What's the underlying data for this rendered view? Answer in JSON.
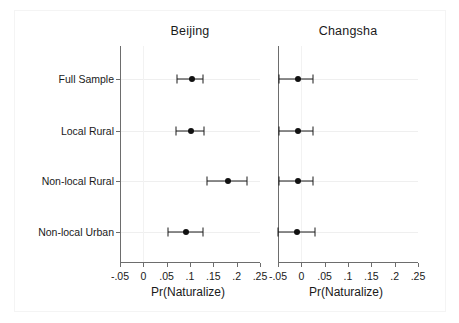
{
  "figure": {
    "background_color": "#ffffff",
    "foreground_color": "#1a1a1a",
    "grid_color": "#efefef",
    "axis_color": "#6d6d6d",
    "marker_color": "#111111"
  },
  "chart_data": {
    "type": "scatter",
    "title": "",
    "subtitle": "",
    "xlabel": "Pr(Naturalize)",
    "ylabel": "",
    "grid": true,
    "legend": null,
    "orientation": "horizontal",
    "plot_style": "coefficient plot with 95% confidence intervals",
    "xlim": [
      -0.05,
      0.25
    ],
    "xticks": [
      -0.05,
      0,
      0.05,
      0.1,
      0.15,
      0.2,
      0.25
    ],
    "xticklabels": [
      "-.05",
      "0",
      ".05",
      ".1",
      ".15",
      ".2",
      ".25"
    ],
    "categories": [
      "Full Sample",
      "Local Rural",
      "Non-local Rural",
      "Non-local Urban"
    ],
    "panels": [
      {
        "name": "Beijing",
        "title": "Beijing",
        "xlabel": "Pr(Naturalize)",
        "points": [
          {
            "category": "Full Sample",
            "estimate": 0.105,
            "ci_low": 0.072,
            "ci_high": 0.128
          },
          {
            "category": "Local Rural",
            "estimate": 0.103,
            "ci_low": 0.071,
            "ci_high": 0.13
          },
          {
            "category": "Non-local Rural",
            "estimate": 0.182,
            "ci_low": 0.137,
            "ci_high": 0.223
          },
          {
            "category": "Non-local Urban",
            "estimate": 0.092,
            "ci_low": 0.053,
            "ci_high": 0.128
          }
        ]
      },
      {
        "name": "Changsha",
        "title": "Changsha",
        "xlabel": "Pr(Naturalize)",
        "points": [
          {
            "category": "Full Sample",
            "estimate": -0.007,
            "ci_low": -0.048,
            "ci_high": 0.025
          },
          {
            "category": "Local Rural",
            "estimate": -0.008,
            "ci_low": -0.048,
            "ci_high": 0.025
          },
          {
            "category": "Non-local Rural",
            "estimate": -0.008,
            "ci_low": -0.048,
            "ci_high": 0.025
          },
          {
            "category": "Non-local Urban",
            "estimate": -0.009,
            "ci_low": -0.05,
            "ci_high": 0.03
          }
        ]
      }
    ]
  }
}
